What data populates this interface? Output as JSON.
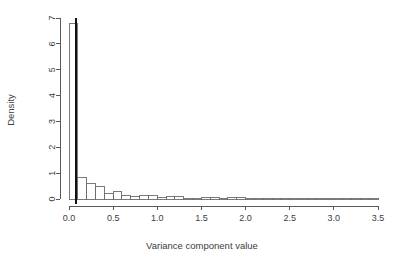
{
  "chart_data": {
    "type": "bar",
    "title": "",
    "xlabel": "Variance component value",
    "ylabel": "Density",
    "xlim": [
      0,
      3.5
    ],
    "ylim": [
      0,
      7
    ],
    "grid": false,
    "legend": false,
    "bin_width": 0.1,
    "xticks": [
      "0.0",
      "0.5",
      "1.0",
      "1.5",
      "2.0",
      "2.5",
      "3.0",
      "3.5"
    ],
    "xtick_values": [
      0.0,
      0.5,
      1.0,
      1.5,
      2.0,
      2.5,
      3.0,
      3.5
    ],
    "yticks": [
      "0",
      "1",
      "2",
      "3",
      "4",
      "5",
      "6",
      "7"
    ],
    "ytick_values": [
      0,
      1,
      2,
      3,
      4,
      5,
      6,
      7
    ],
    "bin_starts": [
      0.0,
      0.1,
      0.2,
      0.3,
      0.4,
      0.5,
      0.6,
      0.7,
      0.8,
      0.9,
      1.0,
      1.1,
      1.2,
      1.3,
      1.4,
      1.5,
      1.6,
      1.7,
      1.8,
      1.9,
      2.0,
      2.1,
      2.2,
      2.3,
      2.4,
      2.5,
      2.6,
      2.7,
      2.8,
      2.9,
      3.0,
      3.1,
      3.2,
      3.3,
      3.4
    ],
    "categories": [
      "0.0-0.1",
      "0.1-0.2",
      "0.2-0.3",
      "0.3-0.4",
      "0.4-0.5",
      "0.5-0.6",
      "0.6-0.7",
      "0.7-0.8",
      "0.8-0.9",
      "0.9-1.0",
      "1.0-1.1",
      "1.1-1.2",
      "1.2-1.3",
      "1.3-1.4",
      "1.4-1.5",
      "1.5-1.6",
      "1.6-1.7",
      "1.7-1.8",
      "1.8-1.9",
      "1.9-2.0",
      "2.0-2.1",
      "2.1-2.2",
      "2.2-2.3",
      "2.3-2.4",
      "2.4-2.5",
      "2.5-2.6",
      "2.6-2.7",
      "2.7-2.8",
      "2.8-2.9",
      "2.9-3.0",
      "3.0-3.1",
      "3.1-3.2",
      "3.2-3.3",
      "3.3-3.4",
      "3.4-3.5"
    ],
    "values": [
      6.8,
      0.82,
      0.6,
      0.48,
      0.2,
      0.29,
      0.14,
      0.1,
      0.14,
      0.13,
      0.05,
      0.08,
      0.08,
      0.03,
      0.02,
      0.05,
      0.05,
      0.01,
      0.06,
      0.06,
      0.01,
      0.01,
      0.0,
      0.0,
      0.01,
      0.0,
      0.0,
      0.01,
      0.0,
      0.0,
      0.0,
      0.01,
      0.0,
      0.0,
      0.01
    ],
    "annotations": [
      {
        "name": "vertical-reference-line",
        "type": "vline",
        "x": 0.08,
        "color": "#121212"
      }
    ]
  },
  "axis": {
    "x_title": "Variance component value",
    "y_title": "Density"
  }
}
